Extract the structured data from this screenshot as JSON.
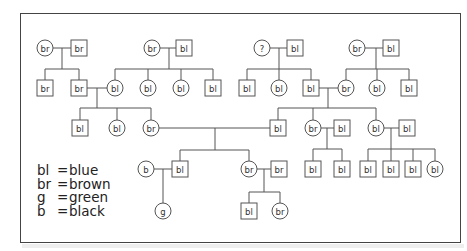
{
  "diagram": {
    "type": "pedigree",
    "frame": {
      "x": 20,
      "y": 13,
      "w": 441,
      "h": 230
    },
    "nodes": [
      {
        "id": "g1a",
        "shape": "circle",
        "label": "br",
        "x": 45,
        "y": 48
      },
      {
        "id": "g1b",
        "shape": "square",
        "label": "br",
        "x": 79,
        "y": 48
      },
      {
        "id": "g1c",
        "shape": "circle",
        "label": "br",
        "x": 152,
        "y": 48
      },
      {
        "id": "g1d",
        "shape": "square",
        "label": "bl",
        "x": 184,
        "y": 48
      },
      {
        "id": "g1e",
        "shape": "circle",
        "label": "?",
        "x": 262,
        "y": 48
      },
      {
        "id": "g1f",
        "shape": "square",
        "label": "bl",
        "x": 295,
        "y": 48
      },
      {
        "id": "g1g",
        "shape": "circle",
        "label": "br",
        "x": 357,
        "y": 48
      },
      {
        "id": "g1h",
        "shape": "square",
        "label": "bl",
        "x": 391,
        "y": 48
      },
      {
        "id": "g2a",
        "shape": "square",
        "label": "br",
        "x": 45,
        "y": 88
      },
      {
        "id": "g2b",
        "shape": "square",
        "label": "br",
        "x": 79,
        "y": 88
      },
      {
        "id": "g2c",
        "shape": "circle",
        "label": "bl",
        "x": 115,
        "y": 88
      },
      {
        "id": "g2d",
        "shape": "circle",
        "label": "bl",
        "x": 148,
        "y": 88
      },
      {
        "id": "g2e",
        "shape": "circle",
        "label": "bl",
        "x": 181,
        "y": 88
      },
      {
        "id": "g2f",
        "shape": "square",
        "label": "bl",
        "x": 213,
        "y": 88
      },
      {
        "id": "g2g",
        "shape": "square",
        "label": "bl",
        "x": 247,
        "y": 88
      },
      {
        "id": "g2h",
        "shape": "circle",
        "label": "bl",
        "x": 279,
        "y": 88
      },
      {
        "id": "g2i",
        "shape": "square",
        "label": "bl",
        "x": 311,
        "y": 88
      },
      {
        "id": "g2j",
        "shape": "circle",
        "label": "br",
        "x": 346,
        "y": 88
      },
      {
        "id": "g2k",
        "shape": "circle",
        "label": "bl",
        "x": 377,
        "y": 88
      },
      {
        "id": "g2l",
        "shape": "square",
        "label": "bl",
        "x": 409,
        "y": 88
      },
      {
        "id": "g3a",
        "shape": "square",
        "label": "bl",
        "x": 80,
        "y": 128
      },
      {
        "id": "g3b",
        "shape": "circle",
        "label": "bl",
        "x": 117,
        "y": 128
      },
      {
        "id": "g3c",
        "shape": "circle",
        "label": "br",
        "x": 151,
        "y": 128
      },
      {
        "id": "g3d",
        "shape": "square",
        "label": "bl",
        "x": 278,
        "y": 128
      },
      {
        "id": "g3e",
        "shape": "circle",
        "label": "br",
        "x": 313,
        "y": 128
      },
      {
        "id": "g3f",
        "shape": "square",
        "label": "bl",
        "x": 342,
        "y": 128
      },
      {
        "id": "g3g",
        "shape": "circle",
        "label": "bl",
        "x": 376,
        "y": 128
      },
      {
        "id": "g3h",
        "shape": "square",
        "label": "bl",
        "x": 407,
        "y": 128
      },
      {
        "id": "g4a",
        "shape": "circle",
        "label": "b",
        "x": 146,
        "y": 169
      },
      {
        "id": "g4b",
        "shape": "square",
        "label": "bl",
        "x": 180,
        "y": 169
      },
      {
        "id": "g4c",
        "shape": "circle",
        "label": "br",
        "x": 249,
        "y": 169
      },
      {
        "id": "g4d",
        "shape": "square",
        "label": "br",
        "x": 279,
        "y": 169
      },
      {
        "id": "g4e",
        "shape": "square",
        "label": "bl",
        "x": 313,
        "y": 169
      },
      {
        "id": "g4f",
        "shape": "square",
        "label": "bl",
        "x": 342,
        "y": 169
      },
      {
        "id": "g4g",
        "shape": "square",
        "label": "bl",
        "x": 368,
        "y": 169
      },
      {
        "id": "g4h",
        "shape": "square",
        "label": "bl",
        "x": 391,
        "y": 169
      },
      {
        "id": "g4i",
        "shape": "square",
        "label": "bl",
        "x": 413,
        "y": 169
      },
      {
        "id": "g4j",
        "shape": "circle",
        "label": "bl",
        "x": 435,
        "y": 169
      },
      {
        "id": "g5a",
        "shape": "circle",
        "label": "g",
        "x": 163,
        "y": 211
      },
      {
        "id": "g5b",
        "shape": "square",
        "label": "bl",
        "x": 249,
        "y": 211
      },
      {
        "id": "g5c",
        "shape": "circle",
        "label": "br",
        "x": 280,
        "y": 211
      }
    ],
    "families": [
      {
        "parents": [
          "g1a",
          "g1b"
        ],
        "junction_x": 62,
        "bar_y": 69,
        "children": [
          "g2a",
          "g2b"
        ]
      },
      {
        "parents": [
          "g1c",
          "g1d"
        ],
        "junction_x": 169,
        "bar_y": 69,
        "children": [
          "g2c",
          "g2d",
          "g2e",
          "g2f"
        ]
      },
      {
        "parents": [
          "g1e",
          "g1f"
        ],
        "junction_x": 279,
        "bar_y": 69,
        "children": [
          "g2g",
          "g2h",
          "g2i"
        ]
      },
      {
        "parents": [
          "g1g",
          "g1h"
        ],
        "junction_x": 376,
        "bar_y": 69,
        "children": [
          "g2j",
          "g2k",
          "g2l"
        ]
      },
      {
        "parents": [
          "g2b",
          "g2c"
        ],
        "junction_x": 97,
        "bar_y": 108,
        "children": [
          "g3a",
          "g3b",
          "g3c"
        ]
      },
      {
        "parents": [
          "g2i",
          "g2j"
        ],
        "junction_x": 328,
        "bar_y": 108,
        "children": [
          "g3d",
          "g3e",
          "g3g"
        ]
      },
      {
        "parents": [
          "g3c",
          "g3d"
        ],
        "junction_x": 215,
        "bar_y": 150,
        "children": [
          "g4b",
          "g4c"
        ]
      },
      {
        "parents": [
          "g3e",
          "g3f"
        ],
        "junction_x": 327,
        "bar_y": 149,
        "children": [
          "g4e",
          "g4f"
        ]
      },
      {
        "parents": [
          "g3g",
          "g3h"
        ],
        "junction_x": 391,
        "bar_y": 149,
        "children": [
          "g4g",
          "g4h",
          "g4i",
          "g4j"
        ]
      },
      {
        "parents": [
          "g4a",
          "g4b"
        ],
        "junction_x": 163,
        "bar_y": 211,
        "children": [
          "g5a"
        ]
      },
      {
        "parents": [
          "g4c",
          "g4d"
        ],
        "junction_x": 264,
        "bar_y": 192,
        "children": [
          "g5b",
          "g5c"
        ]
      }
    ]
  },
  "legend": {
    "items": [
      {
        "key": "bl",
        "eq": "=",
        "value": "blue"
      },
      {
        "key": "br",
        "eq": "=",
        "value": "brown"
      },
      {
        "key": "g",
        "eq": "=",
        "value": "green"
      },
      {
        "key": "b",
        "eq": "=",
        "value": "black"
      }
    ]
  }
}
